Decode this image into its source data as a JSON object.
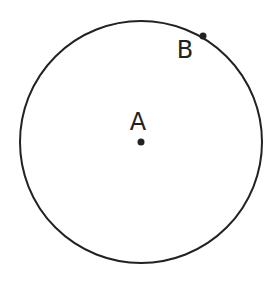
{
  "diagram": {
    "circle": {
      "cx": 141,
      "cy": 142,
      "r": 121,
      "stroke": "#222222"
    },
    "points": [
      {
        "label": "A",
        "x": 141,
        "y": 142,
        "label_x": 138,
        "label_y": 130
      },
      {
        "label": "B",
        "x": 203,
        "y": 36,
        "label_x": 185,
        "label_y": 58
      }
    ]
  }
}
